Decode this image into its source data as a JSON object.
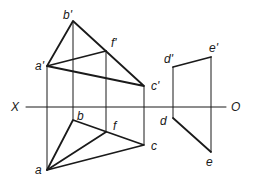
{
  "diagram": {
    "type": "orthographic-projection",
    "axis": {
      "left_label": "X",
      "right_label": "O"
    },
    "front_view": {
      "points": {
        "a_prime": {
          "label": "a'",
          "x": 47,
          "y": 66
        },
        "b_prime": {
          "label": "b'",
          "x": 73,
          "y": 21
        },
        "c_prime": {
          "label": "c'",
          "x": 144,
          "y": 86
        },
        "f_prime": {
          "label": "f'",
          "x": 106,
          "y": 51
        },
        "d_prime": {
          "label": "d'",
          "x": 173,
          "y": 67
        },
        "e_prime": {
          "label": "e'",
          "x": 211,
          "y": 57
        }
      }
    },
    "top_view": {
      "points": {
        "a": {
          "label": "a",
          "x": 47,
          "y": 170
        },
        "b": {
          "label": "b",
          "x": 73,
          "y": 120
        },
        "c": {
          "label": "c",
          "x": 144,
          "y": 145
        },
        "f": {
          "label": "f",
          "x": 106,
          "y": 132
        },
        "d": {
          "label": "d",
          "x": 173,
          "y": 118
        },
        "e": {
          "label": "e",
          "x": 211,
          "y": 152
        }
      }
    },
    "colors": {
      "line": "#1a1a1a",
      "background": "#ffffff"
    }
  }
}
